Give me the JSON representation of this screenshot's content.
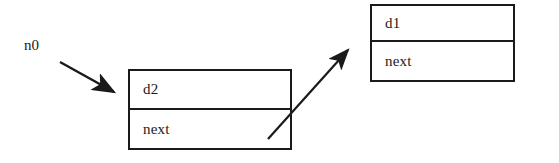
{
  "diagram": {
    "background_color": "#ffffff",
    "stroke_color": "#1a1a1a",
    "text_color": "#1a1a1a",
    "pointer_labels": [
      {
        "id": "n0",
        "text": "n0"
      }
    ],
    "nodes": [
      {
        "id": "node-n1",
        "data_label": "d2",
        "next_label": "next"
      },
      {
        "id": "node-n2",
        "data_label": "d1",
        "next_label": "next"
      }
    ],
    "arrows": [
      {
        "id": "arrow-n0-to-node1",
        "from": "n0",
        "to": "node-n1",
        "x1": 60,
        "y1": 62,
        "x2": 118,
        "y2": 95
      },
      {
        "id": "arrow-node1-next-to-node2",
        "from": "node-n1.next",
        "to": "node-n2",
        "x1": 268,
        "y1": 139,
        "x2": 352,
        "y2": 45
      }
    ]
  }
}
